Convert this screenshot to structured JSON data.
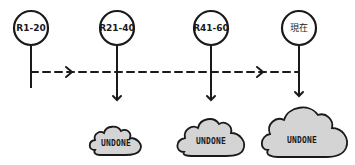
{
  "diagram": {
    "type": "timeline",
    "colors": {
      "stroke": "#1a1a1a",
      "cloud_fill": "#d4d4d4",
      "background": "#ffffff"
    },
    "milestones": [
      {
        "label": "R1-20"
      },
      {
        "label": "R21-40"
      },
      {
        "label": "R41-60"
      },
      {
        "label": "現在"
      }
    ],
    "clouds": [
      {
        "label": "UNDONE",
        "size": "small"
      },
      {
        "label": "UNDONE",
        "size": "medium"
      },
      {
        "label": "UNDONE",
        "size": "large"
      }
    ]
  }
}
